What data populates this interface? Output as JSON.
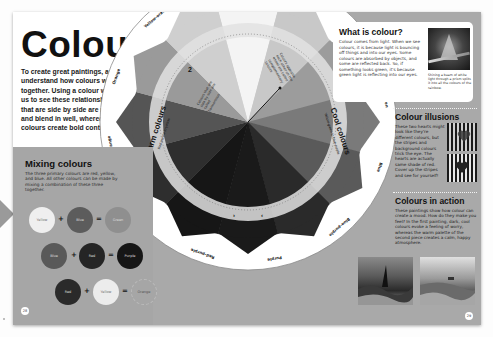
{
  "page": {
    "title": "Colour",
    "intro": "To create great paintings, artists must understand how colours work together. Using a colour wheel helps us to see these relationships. Colours that are side by side are more similar and blend in well, whereas opposing colours create bold contrasts.",
    "left_page_number": "28",
    "right_page_number": "29"
  },
  "mixing": {
    "heading": "Mixing colours",
    "text": "The three primary colours are red, yellow, and blue. All other colours can be made by mixing a combination of these three together.",
    "rows": [
      {
        "a": "Yellow",
        "b": "Blue",
        "result": "Green",
        "colors": [
          "#efefef",
          "#5c5c5c",
          "#8f8f8f"
        ]
      },
      {
        "a": "Blue",
        "b": "Red",
        "result": "Purple",
        "colors": [
          "#595959",
          "#252525",
          "#161616"
        ]
      },
      {
        "a": "Red",
        "b": "Yellow",
        "result": "Orange",
        "colors": [
          "#2a2a2a",
          "#ececec",
          "#a6a6a6"
        ]
      }
    ],
    "operators": {
      "plus": "+",
      "equals": "="
    }
  },
  "wheel": {
    "segments": [
      {
        "label": "Yellow",
        "shade": "#f4f4f4"
      },
      {
        "label": "Yellow-green",
        "shade": "#c8c8c8"
      },
      {
        "label": "Green",
        "shade": "#9c9c9c"
      },
      {
        "label": "Blue-green",
        "shade": "#7a7a7a"
      },
      {
        "label": "Blue",
        "shade": "#5a5a5a"
      },
      {
        "label": "Blue-purple",
        "shade": "#2a2a2a"
      },
      {
        "label": "Purple",
        "shade": "#1a1a1a"
      },
      {
        "label": "Red-purple",
        "shade": "#161616"
      },
      {
        "label": "Red",
        "shade": "#2e2e2e"
      },
      {
        "label": "Red-orange",
        "shade": "#555555"
      },
      {
        "label": "Orange",
        "shade": "#9a9a9a"
      },
      {
        "label": "Yellow-orange",
        "shade": "#cfcfcf"
      }
    ],
    "warm": {
      "title": "Warm colours",
      "subtitle": "Red-purple to yellow"
    },
    "cool": {
      "title": "Cool colours",
      "subtitle": "Yellow-green to blue-purple"
    },
    "annotation_left": "Colours that are side by side are called harmonious",
    "annotation_right": "Colours opposite each other on the wheel are called complementary colours",
    "ring_numbers": [
      "2",
      "1"
    ]
  },
  "what_is_colour": {
    "heading": "What is colour?",
    "text": "Colour comes from light. When we see colours, it is because light is bouncing off things and into our eyes. Some colours are absorbed by objects, and some are reflected back. So, if something looks green, it's because green light is reflecting into our eyes.",
    "image_label": "prism-photo",
    "caption": "Shining a beam of white light through a prism splits it into all the colours of the rainbow."
  },
  "illusions": {
    "heading": "Colour illusions",
    "text": "These two hearts might look like they're different colours, but the stripes and background colours trick the eye. The hearts are actually same shade of red. Cover up the stripes and see for yourself!"
  },
  "action": {
    "heading": "Colours in action",
    "text": "These paintings show how colour can create a mood. How do they make you feel? In the first painting, dark, cool colours evoke a feeling of worry, whereas the warm palette of the second piece creates a calm, happy atmosphere.",
    "paintings": [
      "stormy-sea-painting",
      "calm-sea-painting"
    ]
  }
}
